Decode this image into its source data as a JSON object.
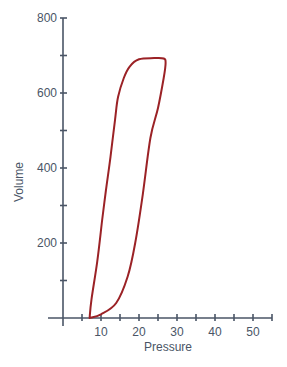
{
  "chart_data": {
    "type": "line",
    "title": "",
    "xlabel": "Pressure",
    "ylabel": "Volume",
    "xlim": [
      0,
      55
    ],
    "ylim": [
      0,
      800
    ],
    "x_tick_labels": [
      "10",
      "20",
      "30",
      "40",
      "50"
    ],
    "x_ticks": [
      10,
      20,
      30,
      40,
      50
    ],
    "x_minor_ticks": [
      5,
      15,
      25,
      35,
      45,
      55
    ],
    "y_tick_labels": [
      "200",
      "400",
      "600",
      "800"
    ],
    "y_ticks": [
      200,
      400,
      600,
      800
    ],
    "y_minor_ticks": [
      100,
      300,
      500,
      700
    ],
    "grid": false,
    "legend": null,
    "series": [
      {
        "name": "Pressure-volume loop",
        "color": "#9b2226",
        "closed": true,
        "x": [
          7,
          10,
          14,
          17,
          19,
          21,
          23,
          25,
          26.5,
          27,
          26.5,
          24,
          20,
          17.5,
          16,
          14.5,
          13.7,
          12.5,
          11.3,
          10.3,
          9,
          7.5,
          7
        ],
        "y": [
          0,
          10,
          40,
          110,
          200,
          330,
          480,
          560,
          640,
          680,
          692,
          693,
          690,
          670,
          640,
          590,
          530,
          430,
          340,
          260,
          150,
          50,
          0
        ]
      }
    ]
  },
  "colors": {
    "axis": "#4a5566",
    "curve": "#9b2226",
    "background": "#ffffff"
  }
}
